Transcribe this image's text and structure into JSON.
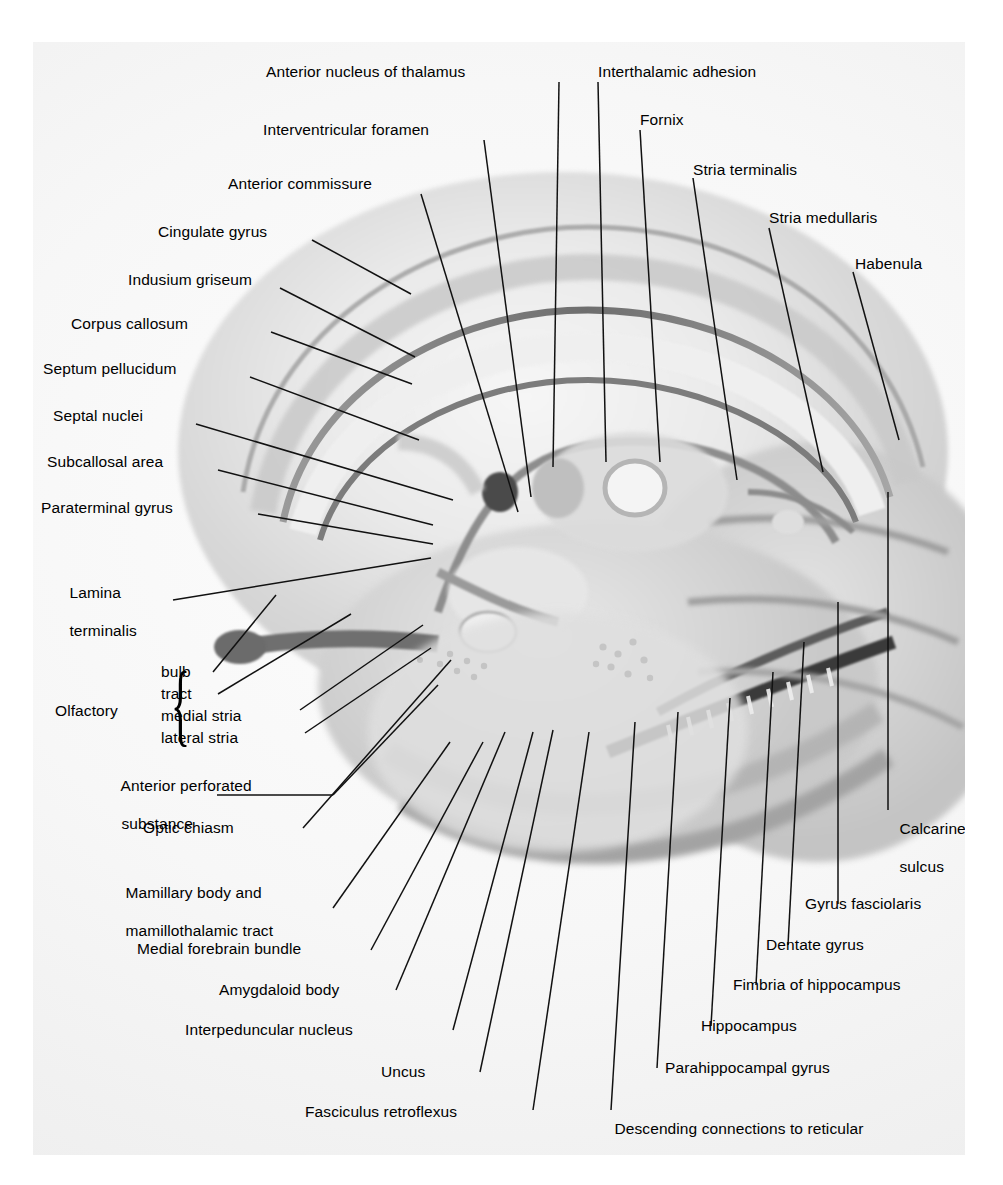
{
  "figure": {
    "kind": "anatomical-diagram",
    "background_color": "#f2f2f2",
    "line_color": "#111111",
    "text_color": "#000000"
  },
  "labels": {
    "anterior_nucleus_of_thalamus": "Anterior nucleus of thalamus",
    "interthalamic_adhesion": "Interthalamic adhesion",
    "interventricular_foramen": "Interventricular foramen",
    "fornix": "Fornix",
    "anterior_commissure": "Anterior commissure",
    "stria_terminalis": "Stria terminalis",
    "cingulate_gyrus": "Cingulate gyrus",
    "stria_medullaris": "Stria medullaris",
    "indusium_griseum": "Indusium griseum",
    "habenula": "Habenula",
    "corpus_callosum": "Corpus callosum",
    "septum_pellucidum": "Septum pellucidum",
    "septal_nuclei": "Septal nuclei",
    "subcallosal_area": "Subcallosal area",
    "paraterminal_gyrus": "Paraterminal gyrus",
    "lamina_terminalis_l1": "Lamina",
    "lamina_terminalis_l2": "terminalis",
    "olfactory": "Olfactory",
    "olfactory_bulb": "bulb",
    "olfactory_tract": "tract",
    "olfactory_medial_stria": "medial stria",
    "olfactory_lateral_stria": "lateral stria",
    "anterior_perforated_l1": "Anterior perforated",
    "anterior_perforated_l2": "substance",
    "optic_chiasm": "Optic chiasm",
    "mamillary_l1": "Mamillary body and",
    "mamillary_l2": "mamillothalamic tract",
    "medial_forebrain_bundle": "Medial forebrain bundle",
    "amygdaloid_body": "Amygdaloid body",
    "interpeduncular_nucleus": "Interpeduncular nucleus",
    "uncus": "Uncus",
    "fasciculus_retroflexus": "Fasciculus retroflexus",
    "descending_l1": "Descending connections to reticular",
    "descending_l2": "and tegmental nuclei of brainstem",
    "parahippocampal_gyrus": "Parahippocampal gyrus",
    "hippocampus": "Hippocampus",
    "fimbria_of_hippocampus": "Fimbria of hippocampus",
    "dentate_gyrus": "Dentate gyrus",
    "gyrus_fasciolaris": "Gyrus fasciolaris",
    "calcarine_sulcus_l1": "Calcarine",
    "calcarine_sulcus_l2": "sulcus",
    "brace_glyph": "{"
  }
}
